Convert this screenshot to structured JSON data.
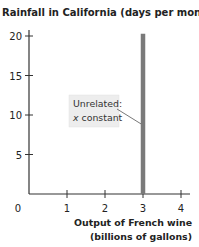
{
  "chart_data": {
    "type": "line",
    "title": "Rainfall in California (days per month)",
    "ylabel": "Rainfall in California (days per month)",
    "xlabel": [
      "Output of French wine",
      "(billions of gallons)"
    ],
    "xlim": [
      0,
      4
    ],
    "ylim": [
      0,
      20
    ],
    "x_ticks": [
      0,
      1,
      2,
      3,
      4
    ],
    "x_tick_labels": [
      "0",
      "1",
      "2",
      "3",
      "4"
    ],
    "y_ticks": [
      5,
      10,
      15,
      20
    ],
    "y_tick_labels": [
      "5",
      "10",
      "15",
      "20"
    ],
    "grid": false,
    "series": [
      {
        "name": "Unrelated: x constant",
        "color": "#7a7a7a",
        "points": [
          {
            "x": 3,
            "y": 0
          },
          {
            "x": 3,
            "y": 20.3
          }
        ]
      }
    ],
    "annotations": [
      {
        "lines": [
          "Unrelated:",
          "x constant"
        ],
        "italic_prefix": "x",
        "points_to": {
          "x": 3,
          "y": 9
        }
      }
    ]
  }
}
